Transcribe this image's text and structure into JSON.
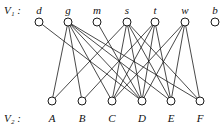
{
  "diagram": {
    "type": "bipartite-graph",
    "set1_label": "V₁ :",
    "set2_label": "V₂ :",
    "set1": [
      {
        "id": "d",
        "label": "d",
        "x": 39
      },
      {
        "id": "g",
        "label": "g",
        "x": 68
      },
      {
        "id": "m",
        "label": "m",
        "x": 97
      },
      {
        "id": "s",
        "label": "s",
        "x": 127
      },
      {
        "id": "t",
        "label": "t",
        "x": 155
      },
      {
        "id": "w",
        "label": "w",
        "x": 185
      },
      {
        "id": "b",
        "label": "b",
        "x": 215
      }
    ],
    "set2": [
      {
        "id": "A",
        "label": "A",
        "x": 52
      },
      {
        "id": "B",
        "label": "B",
        "x": 82
      },
      {
        "id": "C",
        "label": "C",
        "x": 112
      },
      {
        "id": "D",
        "label": "D",
        "x": 142
      },
      {
        "id": "E",
        "label": "E",
        "x": 171
      },
      {
        "id": "F",
        "label": "F",
        "x": 200
      }
    ],
    "edges": [
      [
        "d",
        "D"
      ],
      [
        "g",
        "A"
      ],
      [
        "g",
        "B"
      ],
      [
        "g",
        "C"
      ],
      [
        "g",
        "D"
      ],
      [
        "g",
        "E"
      ],
      [
        "g",
        "F"
      ],
      [
        "m",
        "D"
      ],
      [
        "s",
        "A"
      ],
      [
        "s",
        "C"
      ],
      [
        "s",
        "D"
      ],
      [
        "s",
        "E"
      ],
      [
        "s",
        "F"
      ],
      [
        "t",
        "B"
      ],
      [
        "t",
        "C"
      ],
      [
        "t",
        "D"
      ],
      [
        "t",
        "E"
      ],
      [
        "w",
        "C"
      ],
      [
        "w",
        "D"
      ],
      [
        "w",
        "E"
      ],
      [
        "w",
        "F"
      ]
    ]
  }
}
